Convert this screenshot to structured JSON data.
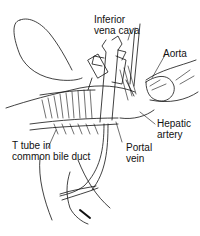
{
  "diagram": {
    "type": "anatomical line drawing",
    "labels": [
      {
        "id": "ivc",
        "line1": "Inferior",
        "line2": "vena cava"
      },
      {
        "id": "aorta",
        "line1": "Aorta"
      },
      {
        "id": "hepatic_artery",
        "line1": "Hepatic",
        "line2": "artery"
      },
      {
        "id": "portal_vein",
        "line1": "Portal",
        "line2": "vein"
      },
      {
        "id": "t_tube",
        "line1": "T tube in",
        "line2": "common bile duct"
      }
    ],
    "colors": {
      "ink": "#111111",
      "background": "#ffffff"
    }
  }
}
